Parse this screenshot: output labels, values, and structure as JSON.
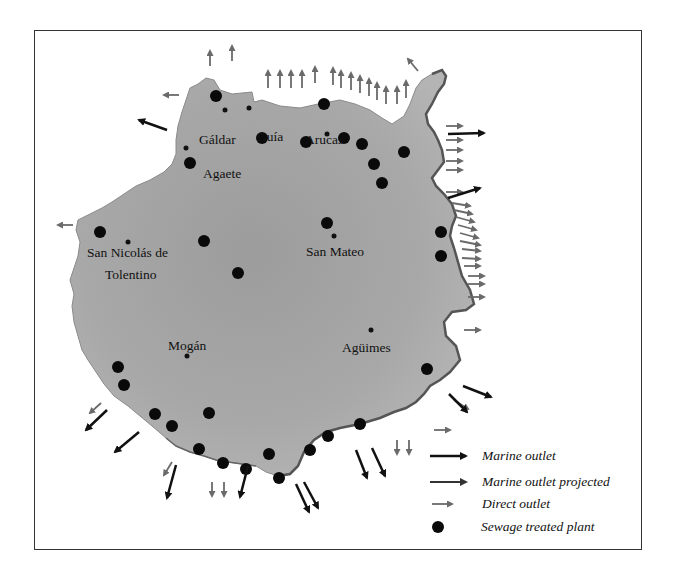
{
  "map": {
    "island": "Gran Canaria",
    "colors": {
      "land": "#a9a9a9",
      "land_dark": "#8e8e8e",
      "coast_edge": "#555555",
      "marine_outlet": "#111111",
      "marine_outlet_projected": "#333333",
      "direct_outlet": "#6a6a6a",
      "plant": "#0a0a0a"
    },
    "towns": [
      {
        "name": "Gáldar",
        "x": 208,
        "y": 139
      },
      {
        "name": "Guía",
        "x": 257,
        "y": 137
      },
      {
        "name": "Arucas",
        "x": 306,
        "y": 140
      },
      {
        "name": "Agaete",
        "x": 203,
        "y": 175
      },
      {
        "name": "San Nicolás de",
        "x": 88,
        "y": 245
      },
      {
        "name": "Tolentino",
        "x": 106,
        "y": 264
      },
      {
        "name": "San Mateo",
        "x": 311,
        "y": 256
      },
      {
        "name": "Mogán",
        "x": 168,
        "y": 350
      },
      {
        "name": "Agüimes",
        "x": 344,
        "y": 352
      }
    ],
    "legend": {
      "items": [
        {
          "symbol": "marine-outlet-arrow",
          "label": "Marine outlet"
        },
        {
          "symbol": "marine-outlet-projected-arrow",
          "label": "Marine outlet projected"
        },
        {
          "symbol": "direct-outlet-arrow",
          "label": "Direct outlet"
        },
        {
          "symbol": "sewage-plant-dot",
          "label": "Sewage treated plant"
        }
      ]
    }
  }
}
